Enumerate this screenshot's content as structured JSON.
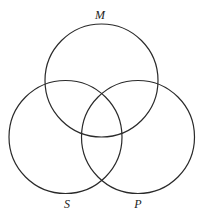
{
  "diagram": {
    "type": "venn",
    "sets": [
      {
        "id": "M",
        "label": "M",
        "cx": 101.5,
        "cy": 80.5,
        "r": 56.5,
        "label_x": 100,
        "label_y": 19
      },
      {
        "id": "S",
        "label": "S",
        "cx": 65.5,
        "cy": 137,
        "r": 56.5,
        "label_x": 67,
        "label_y": 208
      },
      {
        "id": "P",
        "label": "P",
        "cx": 138,
        "cy": 137,
        "r": 56.5,
        "label_x": 138,
        "label_y": 208
      }
    ],
    "stroke_color": "#2a2a2a",
    "background": "#ffffff"
  }
}
